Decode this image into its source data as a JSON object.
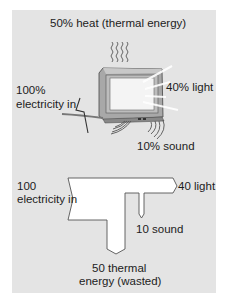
{
  "top_diagram": {
    "heat_label": "50% heat (thermal energy)",
    "electricity_label_line1": "100%",
    "electricity_label_line2": "electricity in",
    "light_label": "40% light",
    "sound_label": "10% sound",
    "icons": [
      "heat-waves-icon",
      "television-icon",
      "lightning-bolt-icon",
      "light-rays-icon",
      "sound-waves-icon"
    ]
  },
  "sankey": {
    "input_line1": "100",
    "input_line2": "electricity in",
    "light_output": "40 light",
    "sound_output": "10 sound",
    "thermal_line1": "50 thermal",
    "thermal_line2": "energy (wasted)"
  },
  "colors": {
    "panel": "#e4e4e4",
    "flow_fill": "#ffffff",
    "flow_stroke": "#555555",
    "tv_body": "#b8b8b8",
    "tv_screen": "#f4f4f4"
  }
}
